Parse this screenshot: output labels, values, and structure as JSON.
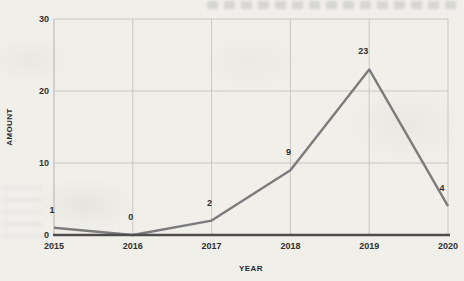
{
  "colors": {
    "background": "#f0efea",
    "gridline": "#c9c8c3",
    "y_axis_line": "#b3b2ad",
    "x_axis_line": "#4d4d4d",
    "data_line": "#7c7c7c",
    "label_text": "#303030"
  },
  "chart_data": {
    "type": "line",
    "categories": [
      "2015",
      "2016",
      "2017",
      "2018",
      "2019",
      "2020"
    ],
    "values": [
      1,
      0,
      2,
      9,
      23,
      4
    ],
    "data_labels": [
      "1",
      "0",
      "2",
      "9",
      "23",
      "4"
    ],
    "xlabel": "YEAR",
    "ylabel": "AMOUNT",
    "ylim": [
      0,
      30
    ],
    "yticks": [
      0,
      10,
      20,
      30
    ],
    "grid": true,
    "legend": false
  }
}
